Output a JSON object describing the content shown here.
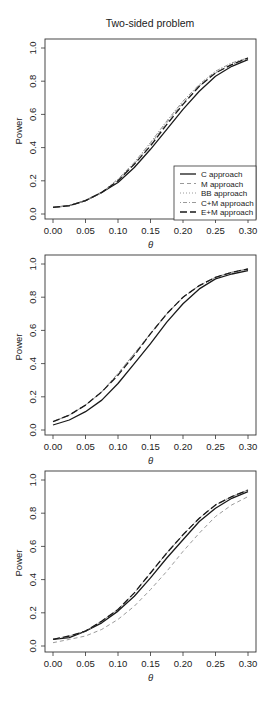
{
  "figure": {
    "title": "Two-sided problem",
    "colors": {
      "black": "#1a1a1a",
      "gray": "#9a9a9a",
      "axis": "#333333"
    }
  },
  "chart_data": [
    {
      "type": "line",
      "title": "Two-sided problem",
      "xlabel": "θ",
      "ylabel": "Power",
      "xlim": [
        0,
        0.3
      ],
      "ylim": [
        0,
        1
      ],
      "xticks": [
        "0.00",
        "0.05",
        "0.10",
        "0.15",
        "0.20",
        "0.25",
        "0.30"
      ],
      "yticks": [
        "0.0",
        "0.2",
        "0.4",
        "0.6",
        "0.8",
        "1.0"
      ],
      "grid": false,
      "legend": {
        "position": "bottom-right",
        "entries": [
          "C approach",
          "M approach",
          "BB approach",
          "C+M approach",
          "E+M approach"
        ]
      },
      "x": [
        0.0,
        0.025,
        0.05,
        0.075,
        0.1,
        0.125,
        0.15,
        0.175,
        0.2,
        0.225,
        0.25,
        0.275,
        0.3
      ],
      "series": [
        {
          "name": "C approach",
          "style": "solid",
          "color": "black",
          "values": [
            0.04,
            0.05,
            0.08,
            0.13,
            0.19,
            0.28,
            0.39,
            0.51,
            0.63,
            0.74,
            0.83,
            0.89,
            0.93
          ]
        },
        {
          "name": "M approach",
          "style": "dashed",
          "color": "gray",
          "values": [
            0.04,
            0.05,
            0.08,
            0.13,
            0.2,
            0.3,
            0.42,
            0.55,
            0.67,
            0.77,
            0.85,
            0.9,
            0.94
          ]
        },
        {
          "name": "BB approach",
          "style": "dotted",
          "color": "gray",
          "values": [
            0.04,
            0.05,
            0.08,
            0.13,
            0.21,
            0.31,
            0.43,
            0.56,
            0.68,
            0.78,
            0.86,
            0.91,
            0.94
          ]
        },
        {
          "name": "C+M approach",
          "style": "dotdash",
          "color": "gray",
          "values": [
            0.04,
            0.05,
            0.08,
            0.13,
            0.21,
            0.31,
            0.43,
            0.56,
            0.68,
            0.78,
            0.86,
            0.91,
            0.94
          ]
        },
        {
          "name": "E+M approach",
          "style": "longdash",
          "color": "black",
          "values": [
            0.04,
            0.05,
            0.08,
            0.13,
            0.2,
            0.3,
            0.41,
            0.54,
            0.66,
            0.77,
            0.85,
            0.9,
            0.94
          ]
        }
      ]
    },
    {
      "type": "line",
      "title": "",
      "xlabel": "θ",
      "ylabel": "Power",
      "xlim": [
        0,
        0.3
      ],
      "ylim": [
        0,
        1
      ],
      "xticks": [
        "0.00",
        "0.05",
        "0.10",
        "0.15",
        "0.20",
        "0.25",
        "0.30"
      ],
      "yticks": [
        "0.0",
        "0.2",
        "0.4",
        "0.6",
        "0.8",
        "1.0"
      ],
      "grid": false,
      "x": [
        0.0,
        0.025,
        0.05,
        0.075,
        0.1,
        0.125,
        0.15,
        0.175,
        0.2,
        0.225,
        0.25,
        0.275,
        0.3
      ],
      "series": [
        {
          "name": "C approach",
          "style": "solid",
          "color": "black",
          "values": [
            0.03,
            0.06,
            0.11,
            0.18,
            0.28,
            0.4,
            0.52,
            0.65,
            0.76,
            0.85,
            0.91,
            0.94,
            0.96
          ]
        },
        {
          "name": "M approach",
          "style": "dashed",
          "color": "gray",
          "values": [
            0.05,
            0.09,
            0.15,
            0.23,
            0.34,
            0.46,
            0.58,
            0.7,
            0.8,
            0.87,
            0.92,
            0.95,
            0.97
          ]
        },
        {
          "name": "BB approach",
          "style": "dotted",
          "color": "gray",
          "values": [
            0.05,
            0.09,
            0.15,
            0.23,
            0.34,
            0.46,
            0.58,
            0.7,
            0.8,
            0.87,
            0.92,
            0.95,
            0.97
          ]
        },
        {
          "name": "C+M approach",
          "style": "dotdash",
          "color": "gray",
          "values": [
            0.05,
            0.09,
            0.15,
            0.23,
            0.34,
            0.46,
            0.58,
            0.7,
            0.8,
            0.87,
            0.92,
            0.95,
            0.97
          ]
        },
        {
          "name": "E+M approach",
          "style": "longdash",
          "color": "black",
          "values": [
            0.05,
            0.09,
            0.15,
            0.23,
            0.33,
            0.45,
            0.58,
            0.7,
            0.8,
            0.87,
            0.92,
            0.95,
            0.97
          ]
        }
      ]
    },
    {
      "type": "line",
      "title": "",
      "xlabel": "θ",
      "ylabel": "Power",
      "xlim": [
        0,
        0.3
      ],
      "ylim": [
        0,
        1
      ],
      "xticks": [
        "0.00",
        "0.05",
        "0.10",
        "0.15",
        "0.20",
        "0.25",
        "0.30"
      ],
      "yticks": [
        "0.0",
        "0.2",
        "0.4",
        "0.6",
        "0.8",
        "1.0"
      ],
      "grid": false,
      "x": [
        0.0,
        0.025,
        0.05,
        0.075,
        0.1,
        0.125,
        0.15,
        0.175,
        0.2,
        0.225,
        0.25,
        0.275,
        0.3
      ],
      "series": [
        {
          "name": "C approach",
          "style": "solid",
          "color": "black",
          "values": [
            0.04,
            0.05,
            0.09,
            0.14,
            0.21,
            0.3,
            0.41,
            0.53,
            0.64,
            0.75,
            0.83,
            0.89,
            0.93
          ]
        },
        {
          "name": "M approach",
          "style": "dashed",
          "color": "gray",
          "values": [
            0.02,
            0.04,
            0.06,
            0.1,
            0.16,
            0.24,
            0.34,
            0.45,
            0.57,
            0.68,
            0.78,
            0.85,
            0.9
          ]
        },
        {
          "name": "BB approach",
          "style": "dotted",
          "color": "gray",
          "values": [
            0.04,
            0.06,
            0.09,
            0.15,
            0.22,
            0.32,
            0.44,
            0.56,
            0.67,
            0.77,
            0.85,
            0.9,
            0.94
          ]
        },
        {
          "name": "C+M approach",
          "style": "dotdash",
          "color": "gray",
          "values": [
            0.04,
            0.06,
            0.09,
            0.15,
            0.22,
            0.32,
            0.44,
            0.56,
            0.67,
            0.77,
            0.85,
            0.9,
            0.94
          ]
        },
        {
          "name": "E+M approach",
          "style": "longdash",
          "color": "black",
          "values": [
            0.04,
            0.06,
            0.09,
            0.15,
            0.22,
            0.32,
            0.44,
            0.56,
            0.67,
            0.77,
            0.85,
            0.9,
            0.94
          ]
        }
      ]
    }
  ]
}
